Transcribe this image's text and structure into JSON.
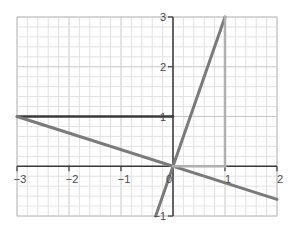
{
  "chart_data": {
    "type": "line",
    "title": "",
    "xlabel": "",
    "ylabel": "",
    "xlim": [
      -3,
      2
    ],
    "ylim": [
      -1,
      3
    ],
    "grid": true,
    "grid_minor_step": 0.2,
    "x_ticks": [
      -3,
      -2,
      -1,
      0,
      1,
      2
    ],
    "y_ticks": [
      -1,
      1,
      2,
      3
    ],
    "x_tick_labels": [
      "−3",
      "−2",
      "−1",
      "0",
      "1",
      "2"
    ],
    "y_tick_labels": [
      "−1",
      "1",
      "2",
      "3"
    ],
    "series": [
      {
        "name": "horizontal y=1 segment",
        "color": "#3a3a3a",
        "points": [
          [
            -3,
            1
          ],
          [
            0,
            1
          ]
        ]
      },
      {
        "name": "steep line y=3x",
        "color": "#7a7a7a",
        "points": [
          [
            -0.333,
            -1
          ],
          [
            1,
            3
          ]
        ]
      },
      {
        "name": "line y=-x/3",
        "color": "#7a7a7a",
        "points": [
          [
            -3,
            1
          ],
          [
            2,
            -0.667
          ]
        ]
      },
      {
        "name": "vertical x=1 segment",
        "color": "#b0b0b0",
        "points": [
          [
            1,
            0
          ],
          [
            1,
            3
          ]
        ]
      },
      {
        "name": "horizontal y=0 segment",
        "color": "#b0b0b0",
        "points": [
          [
            0,
            0
          ],
          [
            1,
            0
          ]
        ]
      }
    ]
  },
  "colors": {
    "axis": "#3a3a3a",
    "grid_major": "#c8c8c8",
    "grid_minor": "#e2e2e2",
    "dark_line": "#3a3a3a",
    "mid_line": "#7a7a7a",
    "light_line": "#b0b0b0"
  }
}
